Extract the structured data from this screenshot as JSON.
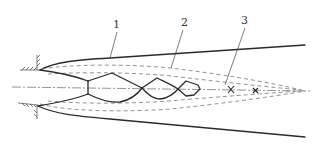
{
  "diagram": {
    "type": "underexpanded jet structure schematic",
    "labels": [
      {
        "id": "1",
        "text": "1",
        "refers_to": "outer jet boundary"
      },
      {
        "id": "2",
        "text": "2",
        "refers_to": "dashed mixing layer boundary"
      },
      {
        "id": "3",
        "text": "3",
        "refers_to": "core tip / x markers on axis"
      }
    ],
    "elements": {
      "nozzle_wall": "hatched wall at nozzle exit",
      "centerline": "dash-dot axis",
      "shock_cells": 4,
      "axis_markers": 2
    },
    "colors": {
      "line": "#2a2a2a",
      "dashed": "#777777",
      "background": "#ffffff"
    }
  }
}
